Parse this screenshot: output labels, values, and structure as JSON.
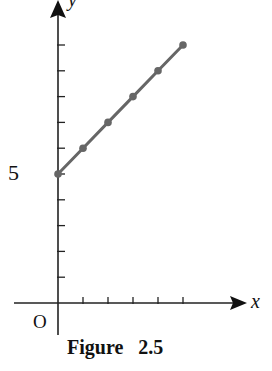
{
  "figure": {
    "caption": "Figure   2.5",
    "origin_label": "O",
    "x_axis_label": "x",
    "y_axis_label": "y",
    "y_tick_label": "5",
    "colors": {
      "axis": "#222222",
      "line": "#666666",
      "point": "#666666",
      "text": "#111111"
    }
  },
  "chart_data": {
    "type": "line",
    "title": "Figure 2.5",
    "xlabel": "x",
    "ylabel": "y",
    "x": [
      0,
      1,
      2,
      3,
      4,
      5
    ],
    "series": [
      {
        "name": "line",
        "values": [
          5,
          6,
          7,
          8,
          9,
          10
        ]
      }
    ],
    "labeled_ticks": {
      "y": [
        5
      ]
    },
    "origin_label": "O",
    "x_ticks": [
      1,
      2,
      3,
      4,
      5
    ],
    "y_ticks": [
      1,
      2,
      3,
      4,
      5,
      6,
      7,
      8,
      9,
      10
    ],
    "xlim": [
      -1.7,
      7.6
    ],
    "ylim": [
      -1.3,
      11.7
    ],
    "grid": false,
    "legend": null
  }
}
